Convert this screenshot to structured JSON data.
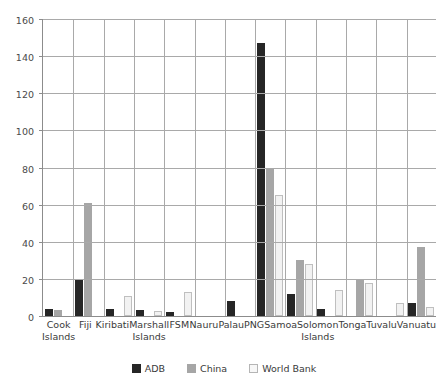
{
  "chart_data": {
    "type": "bar",
    "title": "",
    "subtitle": "",
    "xlabel": "",
    "ylabel": "",
    "ylim": [
      0,
      160
    ],
    "ytick_interval": 20,
    "yticks": [
      0,
      20,
      40,
      60,
      80,
      100,
      120,
      140,
      160
    ],
    "grid": true,
    "legend_position": "bottom",
    "categories": [
      "Cook Islands",
      "Fiji",
      "Kiribati",
      "Marshall Islands",
      "FSM",
      "Nauru",
      "Palau",
      "PNG",
      "Samoa",
      "Solomon Islands",
      "Tonga",
      "Tuvalu",
      "Vanuatu"
    ],
    "category_lines": [
      [
        "Cook",
        "Islands"
      ],
      [
        "Fiji",
        ""
      ],
      [
        "Kiribati",
        ""
      ],
      [
        "Marshall",
        "Islands"
      ],
      [
        "FSM",
        ""
      ],
      [
        "Nauru",
        ""
      ],
      [
        "Palau",
        ""
      ],
      [
        "PNG",
        ""
      ],
      [
        "Samoa",
        ""
      ],
      [
        "Solomon",
        "Islands"
      ],
      [
        "Tonga",
        ""
      ],
      [
        "Tuvalu",
        ""
      ],
      [
        "Vanuatu",
        ""
      ]
    ],
    "series": [
      {
        "name": "ADB",
        "color": "#262626",
        "values": [
          4,
          20,
          4,
          3.5,
          2,
          0,
          8,
          147,
          12,
          4,
          0,
          0,
          7
        ]
      },
      {
        "name": "China",
        "color": "#a6a6a6",
        "values": [
          3.5,
          61,
          0,
          0,
          0,
          0,
          0,
          79,
          30,
          0,
          20,
          0,
          37
        ]
      },
      {
        "name": "World Bank",
        "color": "#f2f2f2",
        "values": [
          0,
          0,
          11,
          2.5,
          13,
          0,
          0,
          65,
          28,
          14,
          18,
          7,
          5
        ]
      }
    ]
  },
  "legend": {
    "items": [
      {
        "label": "ADB",
        "swatch": "adb"
      },
      {
        "label": "China",
        "swatch": "china"
      },
      {
        "label": "World Bank",
        "swatch": "wb"
      }
    ]
  }
}
